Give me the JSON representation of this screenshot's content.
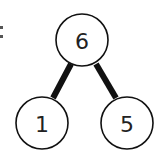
{
  "diagram": {
    "type": "number-bond",
    "whole": {
      "label": "6",
      "cx": 82,
      "cy": 40,
      "r": 26
    },
    "parts": [
      {
        "label": "1",
        "cx": 42,
        "cy": 123,
        "r": 26
      },
      {
        "label": "5",
        "cx": 127,
        "cy": 123,
        "r": 26
      }
    ],
    "edges": [
      {
        "from": "6",
        "to": "1",
        "x1": 71,
        "y1": 64,
        "x2": 53,
        "y2": 98
      },
      {
        "from": "6",
        "to": "5",
        "x1": 96,
        "y1": 64,
        "x2": 116,
        "y2": 98
      }
    ],
    "stroke_color": "#111111",
    "edge_width": 6,
    "circle_stroke_width": 1.6,
    "fill_color": "#ffffff",
    "left_mark": ":"
  }
}
